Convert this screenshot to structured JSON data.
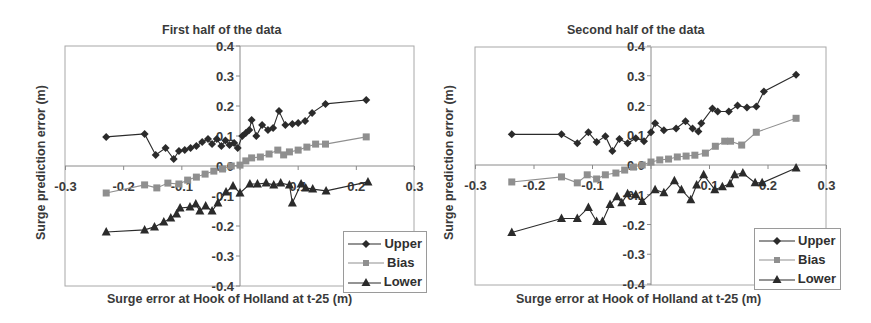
{
  "chart_data": [
    {
      "type": "line",
      "title": "First half of the data",
      "xlabel": "Surge error at Hook of Holland at t-25 (m)",
      "ylabel": "Surge prediction error (m)",
      "xlim": [
        -0.3,
        0.3
      ],
      "ylim": [
        -0.4,
        0.4
      ],
      "xticks": [
        -0.3,
        -0.2,
        -0.1,
        0,
        0.1,
        0.2,
        0.3
      ],
      "xtick_labels": [
        "-0.3",
        "-0.2",
        "-0.1",
        "0",
        "0.1",
        "0.2",
        "0.3"
      ],
      "yticks": [
        0.4,
        0.3,
        0.2,
        0.1,
        0.0,
        -0.1,
        -0.2,
        -0.3,
        -0.4
      ],
      "ytick_labels": [
        "0.4",
        "0.3",
        "0.2",
        "0.1",
        "0.0",
        "-0.1",
        "-0.2",
        "-0.3",
        "-0.4"
      ],
      "grid": false,
      "legend_position": "lower right",
      "series": [
        {
          "name": "Upper",
          "marker": "diamond",
          "color": "#2b2b2b",
          "x": [
            -0.23,
            -0.164,
            -0.145,
            -0.128,
            -0.114,
            -0.105,
            -0.095,
            -0.085,
            -0.075,
            -0.065,
            -0.055,
            -0.048,
            -0.04,
            -0.032,
            -0.025,
            -0.018,
            -0.01,
            -0.004,
            0.004,
            0.01,
            0.016,
            0.02,
            0.028,
            0.038,
            0.048,
            0.057,
            0.067,
            0.078,
            0.09,
            0.1,
            0.112,
            0.124,
            0.147,
            0.217
          ],
          "y": [
            0.097,
            0.107,
            0.037,
            0.06,
            0.023,
            0.05,
            0.053,
            0.06,
            0.067,
            0.08,
            0.09,
            0.073,
            0.09,
            0.067,
            0.085,
            0.07,
            0.077,
            0.06,
            0.1,
            0.11,
            0.12,
            0.153,
            0.1,
            0.137,
            0.12,
            0.127,
            0.183,
            0.137,
            0.14,
            0.143,
            0.15,
            0.177,
            0.207,
            0.22
          ]
        },
        {
          "name": "Bias",
          "marker": "square",
          "color": "#8f8f8f",
          "x": [
            -0.23,
            -0.164,
            -0.143,
            -0.124,
            -0.105,
            -0.09,
            -0.075,
            -0.06,
            -0.045,
            -0.03,
            -0.015,
            0.0,
            0.01,
            0.02,
            0.035,
            0.05,
            0.065,
            0.075,
            0.085,
            0.1,
            0.115,
            0.13,
            0.147,
            0.217
          ],
          "y": [
            -0.09,
            -0.063,
            -0.073,
            -0.057,
            -0.06,
            -0.047,
            -0.037,
            -0.027,
            -0.017,
            -0.01,
            0.0,
            0.003,
            0.017,
            0.027,
            0.03,
            0.04,
            0.053,
            0.037,
            0.047,
            0.053,
            0.063,
            0.073,
            0.073,
            0.097
          ]
        },
        {
          "name": "Lower",
          "marker": "triangle",
          "color": "#2b2b2b",
          "x": [
            -0.23,
            -0.164,
            -0.147,
            -0.131,
            -0.119,
            -0.109,
            -0.103,
            -0.086,
            -0.076,
            -0.069,
            -0.059,
            -0.048,
            -0.038,
            -0.024,
            -0.012,
            0.0,
            0.017,
            0.03,
            0.045,
            0.058,
            0.07,
            0.085,
            0.09,
            0.105,
            0.113,
            0.125,
            0.148,
            0.22
          ],
          "y": [
            -0.22,
            -0.213,
            -0.203,
            -0.187,
            -0.173,
            -0.16,
            -0.14,
            -0.137,
            -0.127,
            -0.15,
            -0.133,
            -0.15,
            -0.123,
            -0.087,
            -0.067,
            -0.09,
            -0.06,
            -0.06,
            -0.057,
            -0.063,
            -0.057,
            -0.063,
            -0.123,
            -0.06,
            -0.073,
            -0.077,
            -0.083,
            -0.053
          ]
        }
      ]
    },
    {
      "type": "line",
      "title": "Second half of the data",
      "xlabel": "Surge error at Hook of Holland at t-25 (m)",
      "ylabel": "Surge prediction error (m)",
      "xlim": [
        -0.3,
        0.3
      ],
      "ylim": [
        -0.4,
        0.4
      ],
      "xticks": [
        -0.3,
        -0.2,
        -0.1,
        0,
        0.1,
        0.2,
        0.3
      ],
      "xtick_labels": [
        "-0.3",
        "-0.2",
        "-0.1",
        "0",
        "0.1",
        "0.2",
        "0.3"
      ],
      "yticks": [
        0.4,
        0.3,
        0.2,
        0.1,
        0.0,
        -0.1,
        -0.2,
        -0.3,
        -0.4
      ],
      "ytick_labels": [
        "0.4",
        "0.3",
        "0.2",
        "0.1",
        "0.0",
        "-0.1",
        "-0.2",
        "-0.3",
        "-0.4"
      ],
      "grid": false,
      "legend_position": "lower right",
      "series": [
        {
          "name": "Upper",
          "marker": "diamond",
          "color": "#2b2b2b",
          "x": [
            -0.238,
            -0.153,
            -0.126,
            -0.107,
            -0.093,
            -0.078,
            -0.066,
            -0.054,
            -0.04,
            -0.026,
            -0.012,
            0.0,
            0.007,
            0.022,
            0.043,
            0.059,
            0.071,
            0.081,
            0.086,
            0.105,
            0.114,
            0.133,
            0.148,
            0.164,
            0.18,
            0.193,
            0.248
          ],
          "y": [
            0.103,
            0.103,
            0.073,
            0.11,
            0.077,
            0.097,
            0.047,
            0.087,
            0.073,
            0.09,
            0.08,
            0.11,
            0.14,
            0.117,
            0.123,
            0.147,
            0.123,
            0.113,
            0.14,
            0.19,
            0.18,
            0.18,
            0.2,
            0.193,
            0.197,
            0.247,
            0.303
          ]
        },
        {
          "name": "Bias",
          "marker": "square",
          "color": "#8f8f8f",
          "x": [
            -0.238,
            -0.153,
            -0.126,
            -0.109,
            -0.093,
            -0.078,
            -0.06,
            -0.045,
            -0.03,
            -0.015,
            0.0,
            0.015,
            0.03,
            0.045,
            0.06,
            0.075,
            0.093,
            0.11,
            0.126,
            0.136,
            0.155,
            0.18,
            0.248
          ],
          "y": [
            -0.057,
            -0.04,
            -0.06,
            -0.033,
            -0.047,
            -0.033,
            -0.027,
            -0.017,
            -0.007,
            0.0,
            0.01,
            0.017,
            0.02,
            0.027,
            0.03,
            0.033,
            0.04,
            0.063,
            0.08,
            0.08,
            0.067,
            0.11,
            0.157
          ]
        },
        {
          "name": "Lower",
          "marker": "triangle",
          "color": "#2b2b2b",
          "x": [
            -0.238,
            -0.153,
            -0.126,
            -0.107,
            -0.093,
            -0.083,
            -0.07,
            -0.058,
            -0.05,
            -0.04,
            -0.026,
            -0.015,
            0.007,
            0.022,
            0.04,
            0.052,
            0.068,
            0.078,
            0.09,
            0.109,
            0.122,
            0.135,
            0.143,
            0.157,
            0.178,
            0.19,
            0.248
          ],
          "y": [
            -0.227,
            -0.18,
            -0.18,
            -0.143,
            -0.19,
            -0.19,
            -0.133,
            -0.107,
            -0.127,
            -0.097,
            -0.1,
            -0.123,
            -0.083,
            -0.093,
            -0.053,
            -0.083,
            -0.117,
            -0.067,
            -0.033,
            -0.083,
            -0.073,
            -0.063,
            -0.033,
            -0.027,
            -0.06,
            -0.06,
            -0.01
          ]
        }
      ]
    }
  ],
  "panels": [
    {
      "title": "First half of the data",
      "xlabel": "Surge error at Hook of Holland at t-25 (m)",
      "ylabel": "Surge prediction error (m)",
      "legend": [
        "Upper",
        "Bias",
        "Lower"
      ]
    },
    {
      "title": "Second half of the data",
      "xlabel": "Surge error at Hook of Holland at t-25 (m)",
      "ylabel": "Surge prediction error (m)",
      "legend": [
        "Upper",
        "Bias",
        "Lower"
      ]
    }
  ]
}
